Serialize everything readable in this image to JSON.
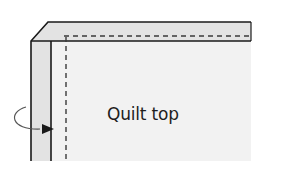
{
  "diagram": {
    "label": "Quilt top",
    "colors": {
      "outline": "#1a1a1a",
      "fold_fill": "#e3e3e3",
      "top_fill": "#f2f2f2",
      "background": "#ffffff",
      "dash": "#3a3a3a",
      "arrow": "#555555"
    }
  }
}
